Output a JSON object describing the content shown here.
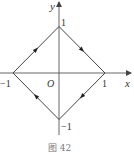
{
  "figure": {
    "caption": "图 42",
    "axes": {
      "x_label": "x",
      "y_label": "y",
      "origin_label": "O"
    },
    "tick_labels": {
      "x_neg": "−1",
      "x_pos": "1",
      "y_pos": "1",
      "y_neg": "−1"
    },
    "shape": {
      "type": "square (diamond) |x|+|y|=1",
      "vertices": [
        [
          -1,
          0
        ],
        [
          0,
          1
        ],
        [
          1,
          0
        ],
        [
          0,
          -1
        ]
      ],
      "orientation": "clockwise",
      "edge_color": "#444444"
    },
    "colors": {
      "axis": "#555555",
      "text": "#333333"
    }
  }
}
